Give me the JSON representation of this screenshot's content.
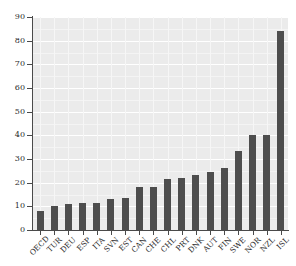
{
  "chart_data": {
    "type": "bar",
    "title": "",
    "subtitle": "",
    "xlabel": "",
    "ylabel": "",
    "ylim": [
      0,
      90
    ],
    "ytick_values": [
      0,
      10,
      20,
      30,
      40,
      50,
      60,
      70,
      80,
      90
    ],
    "ytick_labels": [
      "0",
      "10",
      "20",
      "30",
      "40",
      "50",
      "60",
      "70",
      "80",
      "90"
    ],
    "grid": true,
    "grid_axis": "both",
    "legend": false,
    "legend_position": "none",
    "bar_color": "#4d4d4d",
    "panel_background": "#ebebeb",
    "gridline_color": "#ffffff",
    "axis_color": "#4a4a4a",
    "categories": [
      "OECD",
      "TUR",
      "DEU",
      "ESP",
      "ITA",
      "SVN",
      "EST",
      "CAN",
      "CHE",
      "CHL",
      "PRT",
      "DNK",
      "AUT",
      "FIN",
      "SWE",
      "NOR",
      "NZL",
      "ISL"
    ],
    "values": [
      8.2,
      10.1,
      11.2,
      11.3,
      11.6,
      13.3,
      13.6,
      18.0,
      18.2,
      21.4,
      22.1,
      23.3,
      24.7,
      26.4,
      33.5,
      40.1,
      40.3,
      84.3
    ]
  }
}
